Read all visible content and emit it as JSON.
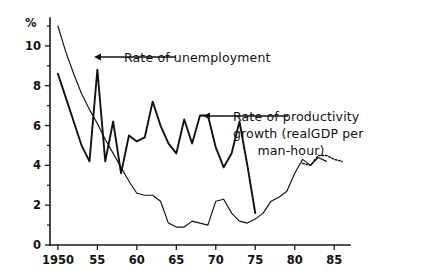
{
  "chart_data": {
    "type": "line",
    "title": "",
    "xlabel": "",
    "ylabel": "%",
    "xlim": [
      1949,
      1987
    ],
    "ylim": [
      0,
      11.4
    ],
    "grid": false,
    "legend_position": "inline-annotations",
    "x_ticks": [
      1950,
      55,
      60,
      65,
      70,
      75,
      80,
      85
    ],
    "x_tick_labels": [
      "1950",
      "55",
      "60",
      "65",
      "70",
      "75",
      "80",
      "85"
    ],
    "y_ticks": [
      0,
      2,
      4,
      6,
      8,
      10
    ],
    "y_tick_labels": [
      "0",
      "2",
      "4",
      "6",
      "8",
      "10"
    ],
    "y_minor_ticks": [
      1,
      3,
      5,
      7,
      9,
      11
    ],
    "series": [
      {
        "name": "Rate of unemployment",
        "style": "thin-solid",
        "x": [
          1950,
          1951,
          1952,
          1953,
          1954,
          1955,
          1956,
          1957,
          1958,
          1959,
          1960,
          1961,
          1962,
          1963,
          1964,
          1965,
          1966,
          1967,
          1968,
          1969,
          1970,
          1971,
          1972,
          1973,
          1974,
          1975,
          1976,
          1977,
          1978,
          1979,
          1980,
          1981,
          1982
        ],
        "values": [
          11.0,
          9.7,
          8.6,
          7.6,
          6.8,
          6.1,
          5.3,
          4.6,
          3.9,
          3.2,
          2.6,
          2.5,
          2.5,
          2.2,
          1.1,
          0.9,
          0.9,
          1.2,
          1.1,
          1.0,
          2.2,
          2.3,
          1.6,
          1.2,
          1.1,
          1.3,
          1.6,
          2.2,
          2.4,
          2.7,
          3.6,
          4.3,
          4.0
        ],
        "annotation": "Rate of unemployment"
      },
      {
        "name": "Rate of unemployment (continued)",
        "style": "thin-solid",
        "x": [
          1982,
          1983,
          1984
        ],
        "values": [
          4.0,
          4.4,
          4.2
        ],
        "annotation": ""
      },
      {
        "name": "Rate of unemployment (projected)",
        "style": "dotted",
        "x": [
          1981,
          1982,
          1983,
          1984,
          1985,
          1986
        ],
        "values": [
          4.1,
          4.0,
          4.5,
          4.5,
          4.3,
          4.2
        ],
        "annotation": ""
      },
      {
        "name": "Rate of productivity growth (real GDP per man-hour)",
        "style": "thick-solid",
        "x": [
          1950,
          1951,
          1952,
          1953,
          1954,
          1955,
          1956,
          1957,
          1958,
          1959,
          1960,
          1961,
          1962,
          1963,
          1964,
          1965,
          1966,
          1967,
          1968,
          1969,
          1970,
          1971,
          1972,
          1973,
          1974,
          1975
        ],
        "values": [
          8.6,
          7.4,
          6.2,
          5.0,
          4.2,
          8.8,
          4.2,
          6.2,
          3.6,
          5.5,
          5.2,
          5.4,
          7.2,
          6.0,
          5.1,
          4.6,
          6.3,
          5.1,
          6.5,
          6.5,
          4.9,
          3.9,
          4.6,
          6.2,
          4.0,
          1.6
        ],
        "annotation": "Rate of productivity growth (realGDP per man-hour)"
      }
    ],
    "annotations": [
      {
        "id": "annot-unemployment",
        "lines": [
          "Rate of unemployment"
        ],
        "text_x": 124,
        "text_y": 62,
        "arrow_from_x": 176,
        "arrow_to_x": 94,
        "arrow_y": 57
      },
      {
        "id": "annot-productivity",
        "lines": [
          "Rate of productivity",
          "growth (realGDP per",
          "man-hour)"
        ],
        "text_x": 233,
        "text_y": 121,
        "arrow_from_x": 288,
        "arrow_to_x": 203,
        "arrow_y": 116
      }
    ]
  },
  "axes": {
    "y_unit_label": "%"
  }
}
